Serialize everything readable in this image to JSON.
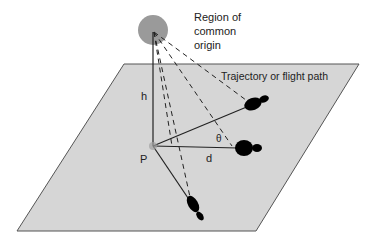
{
  "diagram": {
    "labels": {
      "origin_line1": "Region of",
      "origin_line2": "common",
      "origin_line3": "origin",
      "trajectory": "Trajectory or flight path",
      "height": "h",
      "point": "P",
      "distance": "d",
      "angle": "θ"
    },
    "colors": {
      "plane_fill": "#d6d6d6",
      "plane_stroke": "#555555",
      "origin_fill": "#9a9a9a",
      "line": "#222222",
      "blob": "#000000"
    }
  }
}
